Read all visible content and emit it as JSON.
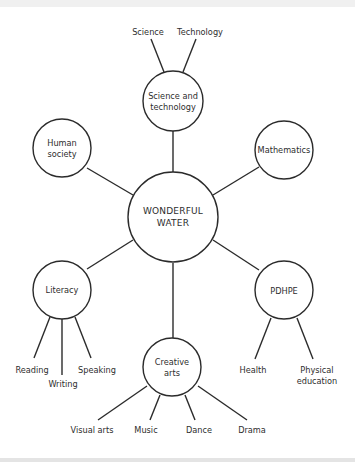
{
  "diagram": {
    "type": "mind-map",
    "colors": {
      "line": "#2b2b2b",
      "text": "#2e2e2e",
      "background": "#ffffff"
    },
    "center": {
      "label": "WONDERFUL\nWATER"
    },
    "nodes": [
      {
        "id": "science-and-technology",
        "label": "Science and\ntechnology",
        "children": [
          "Science",
          "Technology"
        ]
      },
      {
        "id": "human-society",
        "label": "Human\nsociety",
        "children": []
      },
      {
        "id": "mathematics",
        "label": "Mathematics",
        "children": []
      },
      {
        "id": "literacy",
        "label": "Literacy",
        "children": [
          "Reading",
          "Writing",
          "Speaking"
        ]
      },
      {
        "id": "creative-arts",
        "label": "Creative\narts",
        "children": [
          "Visual arts",
          "Music",
          "Dance",
          "Drama"
        ]
      },
      {
        "id": "pdhpe",
        "label": "PDHPE",
        "children": [
          "Health",
          "Physical\neducation"
        ]
      }
    ]
  }
}
